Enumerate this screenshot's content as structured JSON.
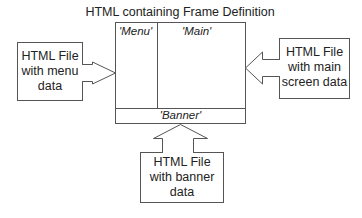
{
  "diagram": {
    "title": "HTML containing Frame Definition",
    "frames": {
      "menu": "'Menu'",
      "main": "'Main'",
      "banner": "'Banner'"
    },
    "sources": {
      "menu": {
        "line1": "HTML File",
        "line2": "with menu",
        "line3": "data"
      },
      "main": {
        "line1": "HTML File",
        "line2": "with main",
        "line3": "screen data"
      },
      "banner": {
        "line1": "HTML File",
        "line2": "with banner",
        "line3": "data"
      }
    },
    "colors": {
      "stroke": "#555555",
      "text": "#222222",
      "background": "#ffffff"
    }
  }
}
